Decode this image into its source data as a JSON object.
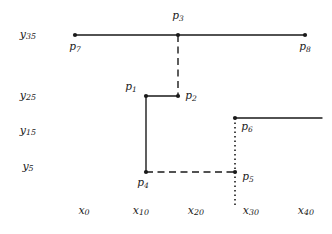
{
  "figure": {
    "title": "",
    "background_color": "#ffffff",
    "stroke_color": "#1a1a1a",
    "width": 332,
    "height": 234
  },
  "axes": {
    "y_labels": [
      {
        "name": "y35",
        "base": "y",
        "sub": "35",
        "text": "y35",
        "y": 35
      },
      {
        "name": "y25",
        "base": "y",
        "sub": "25",
        "text": "y25",
        "y": 96
      },
      {
        "name": "y15",
        "base": "y",
        "sub": "15",
        "text": "y15",
        "y": 131
      },
      {
        "name": "y5",
        "base": "y",
        "sub": "5",
        "text": "y5",
        "y": 167
      }
    ],
    "x_labels": [
      {
        "name": "x0",
        "base": "x",
        "sub": "0",
        "text": "x0",
        "x": 84
      },
      {
        "name": "x10",
        "base": "x",
        "sub": "10",
        "text": "x10",
        "x": 141
      },
      {
        "name": "x20",
        "base": "x",
        "sub": "20",
        "text": "x20",
        "x": 196
      },
      {
        "name": "x30",
        "base": "x",
        "sub": "30",
        "text": "x30",
        "x": 251
      },
      {
        "name": "x40",
        "base": "x",
        "sub": "40",
        "text": "x40",
        "x": 306
      }
    ]
  },
  "chart_data": {
    "type": "scatter",
    "title": "",
    "xlabel": "",
    "ylabel": "",
    "grid": false,
    "legend": "none",
    "x_tick_labels": [
      "x0",
      "x10",
      "x20",
      "x30",
      "x40"
    ],
    "y_tick_labels": [
      "y5",
      "y15",
      "y25",
      "y35"
    ],
    "points": [
      {
        "name": "p1",
        "base": "p",
        "sub": "1",
        "text": "p1",
        "x": 146,
        "y": 96,
        "label_dx": -15,
        "label_dy": -9
      },
      {
        "name": "p2",
        "base": "p",
        "sub": "2",
        "text": "p2",
        "x": 178,
        "y": 96,
        "label_dx": 13,
        "label_dy": 0
      },
      {
        "name": "p3",
        "base": "p",
        "sub": "3",
        "text": "p3",
        "x": 178,
        "y": 35,
        "label_dx": 0,
        "label_dy": -19
      },
      {
        "name": "p4",
        "base": "p",
        "sub": "4",
        "text": "p4",
        "x": 146,
        "y": 172,
        "label_dx": -3,
        "label_dy": 11
      },
      {
        "name": "p5",
        "base": "p",
        "sub": "5",
        "text": "p5",
        "x": 235,
        "y": 172,
        "label_dx": 13,
        "label_dy": 5
      },
      {
        "name": "p6",
        "base": "p",
        "sub": "6",
        "text": "p6",
        "x": 235,
        "y": 118,
        "label_dx": 12,
        "label_dy": 9
      },
      {
        "name": "p7",
        "base": "p",
        "sub": "7",
        "text": "p7",
        "x": 75,
        "y": 35,
        "label_dx": 0,
        "label_dy": 12
      },
      {
        "name": "p8",
        "base": "p",
        "sub": "8",
        "text": "p8",
        "x": 305,
        "y": 35,
        "label_dx": 0,
        "label_dy": 12
      }
    ],
    "segments": [
      {
        "name": "segment-p7-p3",
        "style": "solid",
        "x1": 75,
        "y1": 35,
        "x2": 178,
        "y2": 35
      },
      {
        "name": "segment-p3-p8",
        "style": "solid",
        "x1": 178,
        "y1": 35,
        "x2": 305,
        "y2": 35
      },
      {
        "name": "segment-p3-p2",
        "style": "dashed",
        "x1": 178,
        "y1": 35,
        "x2": 178,
        "y2": 96
      },
      {
        "name": "segment-p1-p2",
        "style": "solid",
        "x1": 146,
        "y1": 96,
        "x2": 178,
        "y2": 96
      },
      {
        "name": "segment-p1-p4",
        "style": "solid",
        "x1": 146,
        "y1": 96,
        "x2": 146,
        "y2": 172
      },
      {
        "name": "segment-p4-p5",
        "style": "dashed",
        "x1": 146,
        "y1": 172,
        "x2": 235,
        "y2": 172
      },
      {
        "name": "segment-p6-right",
        "style": "solid",
        "x1": 235,
        "y1": 118,
        "x2": 322,
        "y2": 118
      },
      {
        "name": "segment-p6-p5-axis",
        "style": "dotted",
        "x1": 235,
        "y1": 118,
        "x2": 235,
        "y2": 205
      }
    ]
  }
}
